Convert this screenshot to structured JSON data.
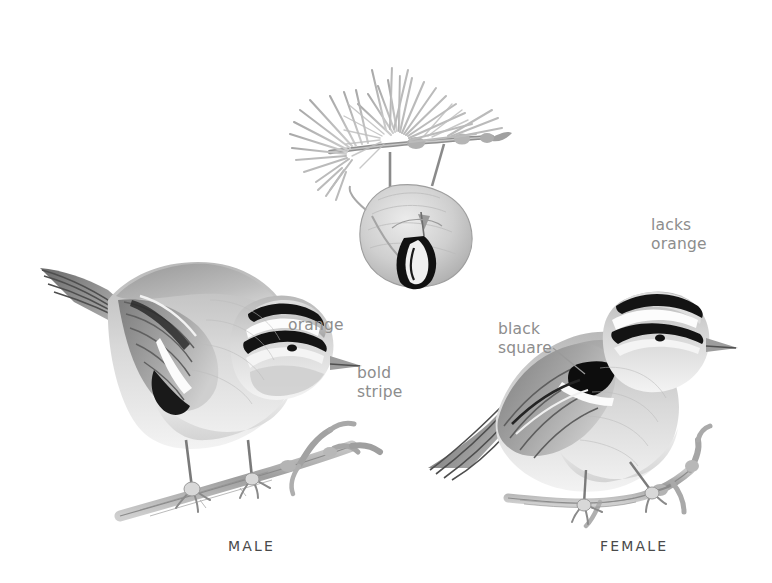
{
  "plate": {
    "title": "Golden-crowned Kinglet identification plate",
    "background_color": "#ffffff",
    "ink_color": "#3a3a3a",
    "label_color": "#8d8d8d",
    "caption_color": "#4a4a4a",
    "width": 772,
    "height": 583
  },
  "annotations": [
    {
      "id": "orange",
      "text": "orange",
      "x": 288,
      "y": 316,
      "leader": false
    },
    {
      "id": "bold-stripe",
      "text": "bold\nstripe",
      "x": 357,
      "y": 364,
      "leader": false
    },
    {
      "id": "black-square",
      "text": "black\nsquare",
      "x": 498,
      "y": 320,
      "leader": true,
      "leader_path": "M 553 348 L 585 374"
    },
    {
      "id": "lacks-orange",
      "text": "lacks\norange",
      "x": 651,
      "y": 216,
      "leader": false
    }
  ],
  "captions": [
    {
      "id": "male",
      "text": "MALE",
      "x": 228,
      "y": 538
    },
    {
      "id": "female",
      "text": "FEMALE",
      "x": 600,
      "y": 538
    }
  ],
  "figures": [
    {
      "id": "hanging-bird",
      "name": "kinglet-hanging-from-conifer-twig",
      "description": "Kinglet hanging upside down beneath a spruce twig, showing the black-bordered orange crown patch from above"
    },
    {
      "id": "male-bird",
      "name": "male-kinglet-perched",
      "description": "Male Golden-crowned Kinglet perched on a bare twig, facing right, bold black-and-white head stripes and orange crown"
    },
    {
      "id": "female-bird",
      "name": "female-kinglet-perched",
      "description": "Female Golden-crowned Kinglet perched on a twig, facing right, yellow crown lacking orange, black square on wing"
    }
  ]
}
